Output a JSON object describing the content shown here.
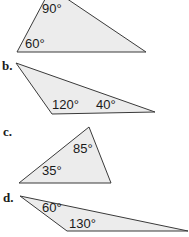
{
  "figure": {
    "background": "#ffffff",
    "fill_color": "#ececec",
    "stroke_color": "#3a3a3a",
    "triangles": [
      {
        "label": "",
        "vertices": [
          [
            17,
            52
          ],
          [
            146,
            52
          ],
          [
            51,
            -12
          ]
        ],
        "angles": [
          {
            "text": "90°",
            "x": 42,
            "y": 13
          },
          {
            "text": "60°",
            "x": 25,
            "y": 48
          }
        ]
      },
      {
        "label": "b.",
        "vertices": [
          [
            16,
            63
          ],
          [
            52,
            114
          ],
          [
            155,
            112
          ]
        ],
        "angles": [
          {
            "text": "120°",
            "x": 52,
            "y": 109
          },
          {
            "text": "40°",
            "x": 96,
            "y": 109
          }
        ]
      },
      {
        "label": "c.",
        "vertices": [
          [
            89,
            127
          ],
          [
            19,
            183
          ],
          [
            111,
            183
          ]
        ],
        "angles": [
          {
            "text": "85°",
            "x": 73,
            "y": 153
          },
          {
            "text": "35°",
            "x": 42,
            "y": 175
          }
        ]
      },
      {
        "label": "d.",
        "vertices": [
          [
            20,
            196
          ],
          [
            67,
            231
          ],
          [
            188,
            231
          ]
        ],
        "angles": [
          {
            "text": "60°",
            "x": 42,
            "y": 212
          },
          {
            "text": "130°",
            "x": 69,
            "y": 228
          }
        ]
      }
    ]
  }
}
